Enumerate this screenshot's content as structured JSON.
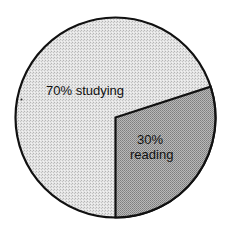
{
  "chart_data": {
    "type": "pie",
    "title": "",
    "categories": [
      "studying",
      "reading"
    ],
    "values": [
      70,
      30
    ],
    "labels": [
      "70% studying",
      "30% reading"
    ],
    "slices": [
      {
        "name": "studying",
        "value": 70,
        "label_line1": "70% studying",
        "label_line2": "",
        "color": "#d9d9d9"
      },
      {
        "name": "reading",
        "value": 30,
        "label_line1": "30%",
        "label_line2": "reading",
        "color": "#a9a9a9"
      }
    ],
    "legend": "none",
    "outline_color": "#111111"
  },
  "colors": {
    "background": "#ffffff",
    "outline": "#111111",
    "studying": "#d9d9d9",
    "reading": "#a9a9a9"
  }
}
